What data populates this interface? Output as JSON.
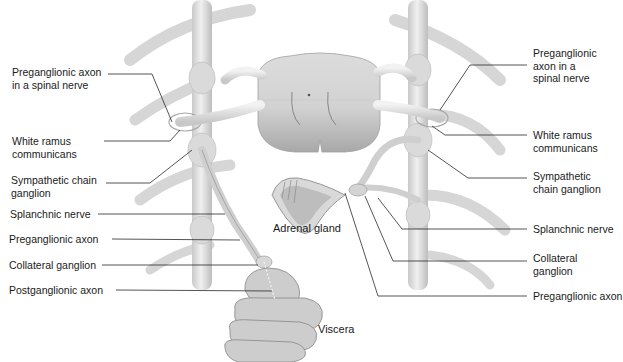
{
  "diagram": {
    "colors": {
      "background": "#ffffff",
      "structure_fill": "#e2e2e2",
      "structure_shade": "#b8b8b8",
      "structure_edge": "#9a9a9a",
      "leader_line": "#2a2a2a",
      "label_text": "#1a1a1a"
    },
    "left_labels": [
      {
        "id": "preganglionic-axon-spinal-nerve-left",
        "lines": [
          "Preganglionic axon",
          "in a spinal nerve"
        ]
      },
      {
        "id": "white-ramus-communicans-left",
        "lines": [
          "White ramus",
          "communicans"
        ]
      },
      {
        "id": "sympathetic-chain-ganglion-left",
        "lines": [
          "Sympathetic chain",
          "ganglion"
        ]
      },
      {
        "id": "splanchnic-nerve-left",
        "lines": [
          "Splanchnic nerve"
        ]
      },
      {
        "id": "preganglionic-axon-left",
        "lines": [
          "Preganglionic axon"
        ]
      },
      {
        "id": "collateral-ganglion-left",
        "lines": [
          "Collateral ganglion"
        ]
      },
      {
        "id": "postganglionic-axon-left",
        "lines": [
          "Postganglionic axon"
        ]
      }
    ],
    "right_labels": [
      {
        "id": "preganglionic-axon-spinal-nerve-right",
        "lines": [
          "Preganglionic",
          "axon in a",
          "spinal nerve"
        ]
      },
      {
        "id": "white-ramus-communicans-right",
        "lines": [
          "White ramus",
          "communicans"
        ]
      },
      {
        "id": "sympathetic-chain-ganglion-right",
        "lines": [
          "Sympathetic",
          "chain ganglion"
        ]
      },
      {
        "id": "splanchnic-nerve-right",
        "lines": [
          "Splanchnic nerve"
        ]
      },
      {
        "id": "collateral-ganglion-right",
        "lines": [
          "Collateral",
          "ganglion"
        ]
      },
      {
        "id": "preganglionic-axon-right",
        "lines": [
          "Preganglionic axon"
        ]
      }
    ],
    "center_labels": {
      "adrenal_gland": "Adrenal gland",
      "viscera": "Viscera"
    }
  }
}
